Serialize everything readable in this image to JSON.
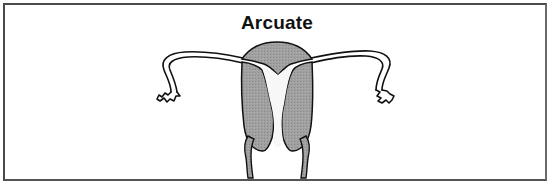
{
  "diagram": {
    "title": "Arcuate",
    "parts": [
      {
        "name": "fundus",
        "description": "shaded uterine fundus with shallow central indentation"
      },
      {
        "name": "left-uterine-wall",
        "description": "shaded left myometrium"
      },
      {
        "name": "right-uterine-wall",
        "description": "shaded right myometrium"
      },
      {
        "name": "uterine-cavity",
        "description": "white cavity with arcuate (saddle) top"
      },
      {
        "name": "left-fallopian-tube",
        "description": "tube extending left with fimbriated end"
      },
      {
        "name": "right-fallopian-tube",
        "description": "tube extending right with fimbriated end"
      },
      {
        "name": "cervix-vaginal-walls",
        "description": "two narrow shaded strips at base"
      }
    ],
    "colors": {
      "fill": "#9a9a9a",
      "outline": "#111111",
      "frame": "#4a4a4a",
      "background": "#ffffff"
    }
  }
}
